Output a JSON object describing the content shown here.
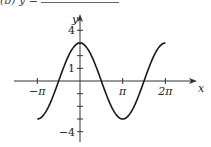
{
  "header": {
    "text": "(b) y ="
  },
  "chart_data": {
    "type": "line",
    "title": "",
    "function": "y = 3cos(x)",
    "xlabel": "x",
    "ylabel": "y",
    "xlim": [
      -3.14159,
      6.28318
    ],
    "ylim": [
      -4,
      4
    ],
    "grid": false,
    "x_ticks": [
      {
        "value": -3.14159,
        "label": "−π"
      },
      {
        "value": 0,
        "label": ""
      },
      {
        "value": 3.14159,
        "label": "π"
      },
      {
        "value": 6.28318,
        "label": "2π"
      }
    ],
    "y_ticks": [
      {
        "value": 4,
        "label": "4"
      },
      {
        "value": 3,
        "label": ""
      },
      {
        "value": 2,
        "label": ""
      },
      {
        "value": 1,
        "label": "1"
      },
      {
        "value": -1,
        "label": ""
      },
      {
        "value": -2,
        "label": ""
      },
      {
        "value": -3,
        "label": ""
      },
      {
        "value": -4,
        "label": "−4"
      }
    ],
    "series": [
      {
        "name": "3cos(x)",
        "x": [
          -3.1416,
          -2.3562,
          -1.5708,
          -0.7854,
          0,
          0.7854,
          1.5708,
          2.3562,
          3.1416,
          3.927,
          4.7124,
          5.4978,
          6.2832
        ],
        "values": [
          -3,
          -2.121,
          0,
          2.121,
          3,
          2.121,
          0,
          -2.121,
          -3,
          -2.121,
          0,
          2.121,
          3
        ]
      }
    ],
    "colors": {
      "curve": "#1a1a1a",
      "axis": "#333333"
    }
  }
}
